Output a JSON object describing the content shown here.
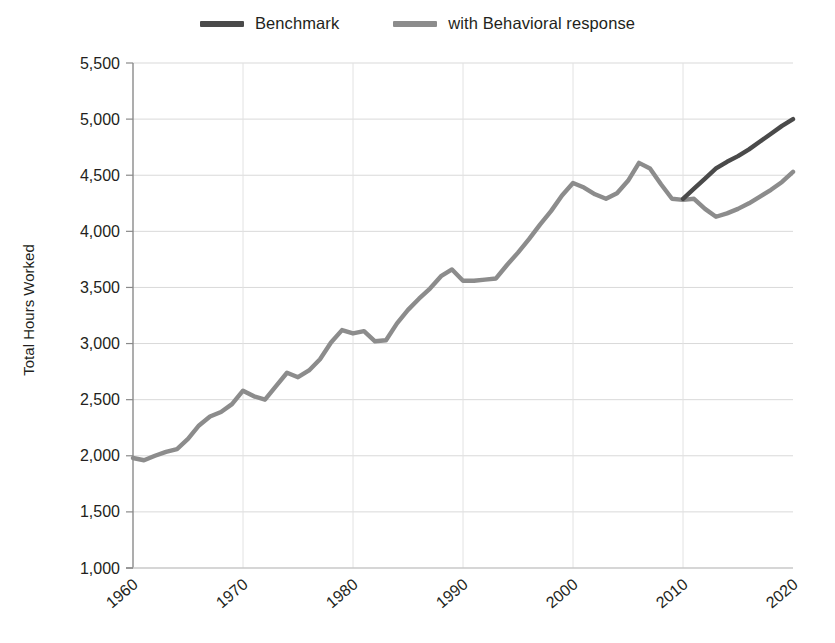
{
  "legend": {
    "entries": [
      {
        "label": "Benchmark",
        "color": "#4a4a4a",
        "icon": "line-swatch-icon"
      },
      {
        "label": "with Behavioral response",
        "color": "#8c8c8c",
        "icon": "line-swatch-icon"
      }
    ]
  },
  "chart_data": {
    "type": "line",
    "title": "",
    "xlabel": "",
    "ylabel": "Total Hours Worked",
    "xlim": [
      1960,
      2020
    ],
    "ylim": [
      1000,
      5500
    ],
    "xticks": [
      "1960",
      "1970",
      "1980",
      "1990",
      "2000",
      "2010",
      "2020"
    ],
    "yticks": [
      "1,000",
      "1,500",
      "2,000",
      "2,500",
      "3,000",
      "3,500",
      "4,000",
      "4,500",
      "5,000",
      "5,500"
    ],
    "grid": true,
    "legend_position": "top-center",
    "x": [
      1960,
      1961,
      1962,
      1963,
      1964,
      1965,
      1966,
      1967,
      1968,
      1969,
      1970,
      1971,
      1972,
      1973,
      1974,
      1975,
      1976,
      1977,
      1978,
      1979,
      1980,
      1981,
      1982,
      1983,
      1984,
      1985,
      1986,
      1987,
      1988,
      1989,
      1990,
      1991,
      1992,
      1993,
      1994,
      1995,
      1996,
      1997,
      1998,
      1999,
      2000,
      2001,
      2002,
      2003,
      2004,
      2005,
      2006,
      2007,
      2008,
      2009,
      2010,
      2011,
      2012,
      2013,
      2014,
      2015,
      2016,
      2017,
      2018,
      2019,
      2020
    ],
    "series": [
      {
        "name": "with Behavioral response",
        "color": "#8c8c8c",
        "values": [
          1980,
          1960,
          2000,
          2035,
          2060,
          2150,
          2270,
          2350,
          2390,
          2460,
          2580,
          2530,
          2500,
          2620,
          2740,
          2700,
          2760,
          2860,
          3010,
          3120,
          3090,
          3110,
          3020,
          3030,
          3180,
          3300,
          3400,
          3490,
          3600,
          3660,
          3560,
          3560,
          3570,
          3580,
          3700,
          3810,
          3930,
          4060,
          4180,
          4320,
          4430,
          4390,
          4330,
          4290,
          4340,
          4450,
          4610,
          4560,
          4420,
          4290,
          4280,
          4290,
          4200,
          4130,
          4160,
          4200,
          4250,
          4310,
          4370,
          4440,
          4530
        ]
      },
      {
        "name": "Benchmark",
        "color": "#4a4a4a",
        "values": [
          null,
          null,
          null,
          null,
          null,
          null,
          null,
          null,
          null,
          null,
          null,
          null,
          null,
          null,
          null,
          null,
          null,
          null,
          null,
          null,
          null,
          null,
          null,
          null,
          null,
          null,
          null,
          null,
          null,
          null,
          null,
          null,
          null,
          null,
          null,
          null,
          null,
          null,
          null,
          null,
          null,
          null,
          null,
          null,
          null,
          null,
          null,
          null,
          null,
          null,
          4290,
          4380,
          4470,
          4560,
          4620,
          4670,
          4730,
          4800,
          4870,
          4940,
          5000
        ]
      }
    ]
  }
}
